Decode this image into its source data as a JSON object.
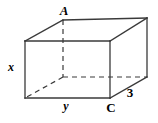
{
  "figure": {
    "name": "rectangular-prism",
    "stroke_color": "#3a3a3a",
    "background_color": "#ffffff",
    "labels": {
      "vertex_a": "A",
      "vertex_c": "C",
      "edge_height": "x",
      "edge_width": "y",
      "edge_depth": "3"
    }
  },
  "geometry": {
    "front_face": {
      "top_left": [
        25,
        41
      ],
      "top_right": [
        110,
        41
      ],
      "bottom_right": [
        110,
        98
      ],
      "bottom_left": [
        25,
        98
      ]
    },
    "back_face": {
      "top_left": [
        63,
        20
      ],
      "top_right": [
        147,
        18
      ],
      "bottom_right": [
        147,
        77
      ],
      "bottom_left": [
        63,
        77
      ]
    },
    "hidden_vertex": [
      63,
      77
    ]
  },
  "label_positions": {
    "vertex_a": [
      64,
      10
    ],
    "vertex_c": [
      111,
      107
    ],
    "edge_height": [
      11,
      67
    ],
    "edge_width": [
      66,
      106
    ],
    "edge_depth": [
      130,
      92
    ]
  }
}
